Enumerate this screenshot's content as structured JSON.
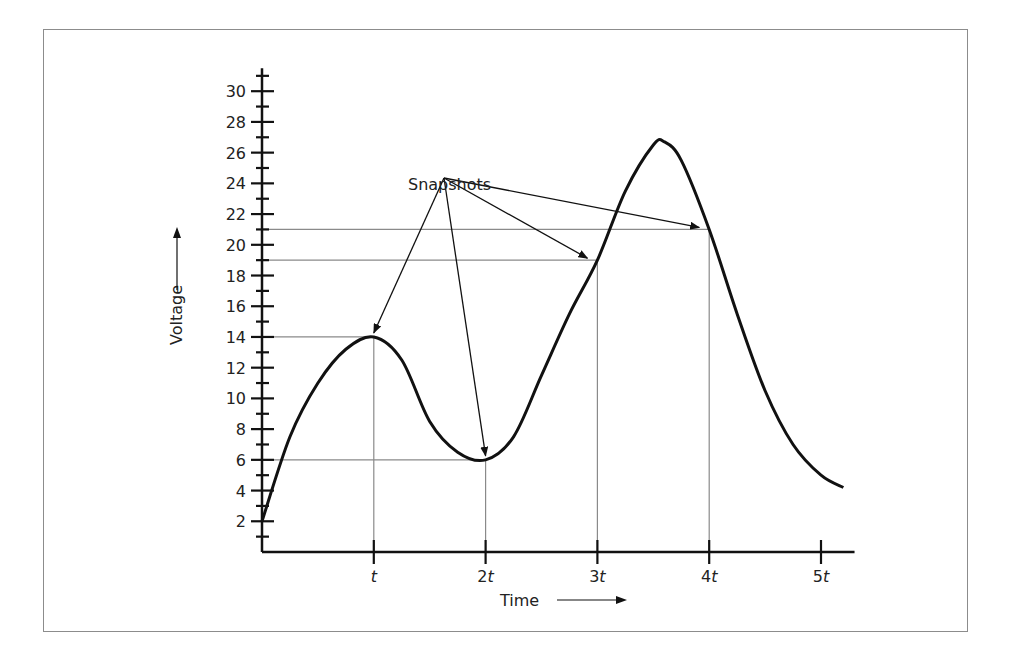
{
  "chart_data": {
    "type": "line",
    "title": "",
    "xlabel": "Time",
    "ylabel": "Voltage",
    "x_tick_labels": [
      "t",
      "2t",
      "3t",
      "4t",
      "5t"
    ],
    "x_ticks": [
      1,
      2,
      3,
      4,
      5
    ],
    "y_tick_labels": [
      "2",
      "4",
      "6",
      "8",
      "10",
      "12",
      "14",
      "16",
      "18",
      "20",
      "22",
      "24",
      "26",
      "28",
      "30"
    ],
    "y_ticks": [
      2,
      4,
      6,
      8,
      10,
      12,
      14,
      16,
      18,
      20,
      22,
      24,
      26,
      28,
      30
    ],
    "ylim": [
      0,
      31
    ],
    "xlim": [
      0,
      5.3
    ],
    "grid": false,
    "series": [
      {
        "name": "Voltage waveform",
        "x": [
          0,
          0.25,
          0.5,
          0.75,
          1.0,
          1.25,
          1.5,
          1.75,
          2.0,
          2.25,
          2.5,
          2.75,
          3.0,
          3.25,
          3.5,
          3.6,
          3.75,
          4.0,
          4.25,
          4.5,
          4.75,
          5.0,
          5.2
        ],
        "values": [
          2,
          7.5,
          11,
          13.2,
          14,
          12.5,
          8.5,
          6.5,
          6,
          7.5,
          11.5,
          15.5,
          19,
          23.5,
          26.5,
          26.7,
          25.5,
          21,
          15.5,
          10.5,
          7,
          5,
          4.2
        ]
      }
    ],
    "snapshots": [
      {
        "x_label": "t",
        "x": 1,
        "value": 14
      },
      {
        "x_label": "2t",
        "x": 2,
        "value": 6
      },
      {
        "x_label": "3t",
        "x": 3,
        "value": 19
      },
      {
        "x_label": "4t",
        "x": 4,
        "value": 21
      }
    ],
    "annotations": [
      {
        "text": "Snapshots",
        "points_to": [
          "t",
          "2t",
          "3t",
          "4t"
        ]
      }
    ],
    "axis_arrows": {
      "x": "Time →",
      "y": "Voltage ↑"
    }
  },
  "labels": {
    "snapshots": "Snapshots",
    "xlabel": "Time",
    "ylabel": "Voltage"
  }
}
